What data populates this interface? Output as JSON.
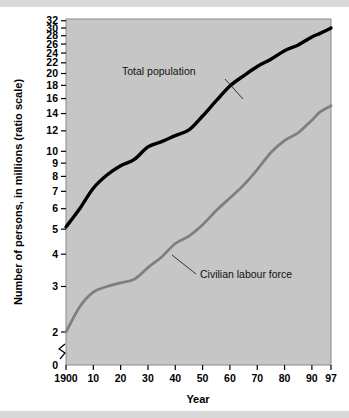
{
  "figure": {
    "background": "#ffffff",
    "plot_background": "#c6c6c6",
    "rule_color": "#d9d9d9"
  },
  "chart_data": {
    "type": "line",
    "title": "",
    "xlabel": "Year",
    "ylabel": "Number of persons, in millions (ratio scale)",
    "yscale": "log",
    "ylim": [
      1.85,
      33.5
    ],
    "xlim": [
      1900,
      1997
    ],
    "grid": false,
    "legend_position": "inline-annotations",
    "axis_break": {
      "present": true,
      "between": [
        0,
        2
      ],
      "symbol": "zigzag"
    },
    "xticks": [
      1900,
      1910,
      1920,
      1930,
      1940,
      1950,
      1960,
      1970,
      1980,
      1990,
      1997
    ],
    "xticklabels": [
      "1900",
      "10",
      "20",
      "30",
      "40",
      "50",
      "60",
      "70",
      "80",
      "90",
      "97"
    ],
    "yticks": [
      2,
      3,
      4,
      5,
      6,
      7,
      8,
      9,
      10,
      12,
      14,
      16,
      18,
      20,
      22,
      24,
      26,
      28,
      30,
      32
    ],
    "yticklabels": [
      "2",
      "3",
      "4",
      "5",
      "6",
      "7",
      "8",
      "9",
      "10",
      "12",
      "14",
      "16",
      "18",
      "20",
      "22",
      "24",
      "26",
      "28",
      "30",
      "32"
    ],
    "zero_tick_label": "0",
    "series": [
      {
        "name": "Total population",
        "color": "#000000",
        "x": [
          1900,
          1905,
          1910,
          1915,
          1920,
          1925,
          1930,
          1935,
          1940,
          1945,
          1950,
          1955,
          1960,
          1965,
          1970,
          1975,
          1980,
          1985,
          1990,
          1993,
          1997
        ],
        "values": [
          5.1,
          6.0,
          7.2,
          8.1,
          8.8,
          9.3,
          10.4,
          10.9,
          11.5,
          12.1,
          13.7,
          15.7,
          17.9,
          19.6,
          21.3,
          22.7,
          24.5,
          25.8,
          27.7,
          28.6,
          30.0
        ]
      },
      {
        "name": "Civilian labour force",
        "color": "#7f7f7f",
        "x": [
          1900,
          1905,
          1910,
          1915,
          1920,
          1925,
          1930,
          1935,
          1940,
          1945,
          1950,
          1955,
          1960,
          1965,
          1970,
          1975,
          1980,
          1985,
          1990,
          1993,
          1997
        ],
        "values": [
          2.0,
          2.5,
          2.85,
          3.0,
          3.1,
          3.2,
          3.55,
          3.9,
          4.4,
          4.7,
          5.2,
          5.9,
          6.6,
          7.4,
          8.5,
          9.9,
          11.0,
          11.8,
          13.2,
          14.2,
          15.0
        ]
      }
    ],
    "annotations": [
      {
        "label": "Total population",
        "text_x": 122,
        "text_y": 75,
        "leader_from": [
          225,
          79
        ],
        "leader_to": [
          243,
          99
        ]
      },
      {
        "label": "Civilian labour force",
        "text_x": 200,
        "text_y": 278,
        "leader_from": [
          196,
          274
        ],
        "leader_to": [
          172,
          255
        ]
      }
    ]
  }
}
